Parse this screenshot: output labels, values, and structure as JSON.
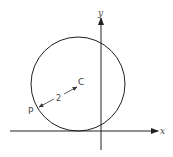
{
  "diagram": {
    "type": "geometry-circle-on-axes",
    "axes": {
      "x_label": "x",
      "y_label": "y"
    },
    "circle": {
      "center_label": "C",
      "point_label": "P",
      "radius_label": "2"
    },
    "colors": {
      "stroke": "#222222",
      "text": "#444444",
      "background": "#ffffff"
    }
  }
}
